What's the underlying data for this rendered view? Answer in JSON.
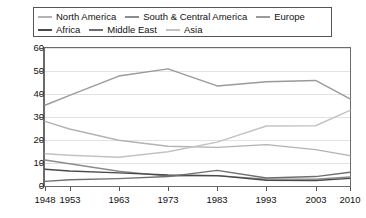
{
  "legend": {
    "rows": [
      [
        {
          "label": "North America",
          "color": "#b3b3b3"
        },
        {
          "label": "South & Central America",
          "color": "#8c8c8c"
        },
        {
          "label": "Europe",
          "color": "#9a9a9a"
        }
      ],
      [
        {
          "label": "Africa",
          "color": "#4a4a4a"
        },
        {
          "label": "Middle East",
          "color": "#6f6f6f"
        },
        {
          "label": "Asia",
          "color": "#c2c2c2"
        }
      ]
    ]
  },
  "axes": {
    "y_ticks": [
      "60",
      "50",
      "40",
      "30",
      "20",
      "10",
      "0"
    ],
    "x_ticks": [
      "1948",
      "1953",
      "1963",
      "1973",
      "1983",
      "1993",
      "2003",
      "2010"
    ]
  },
  "chart_data": {
    "type": "line",
    "title": "",
    "subtitle": "",
    "xlabel": "",
    "ylabel": "",
    "x": [
      1948,
      1953,
      1963,
      1973,
      1983,
      1993,
      2003,
      2010
    ],
    "categories": [
      "1948",
      "1953",
      "1963",
      "1973",
      "1983",
      "1993",
      "2003",
      "2010"
    ],
    "xlim": [
      1948,
      2010
    ],
    "ylim": [
      0,
      60
    ],
    "ytick_step": 10,
    "grid": true,
    "legend_position": "top",
    "series": [
      {
        "name": "North America",
        "color": "#b3b3b3",
        "values": [
          28.1,
          24.8,
          19.9,
          17.3,
          16.8,
          18.0,
          15.8,
          13.2
        ]
      },
      {
        "name": "South & Central America",
        "color": "#8c8c8c",
        "values": [
          11.3,
          9.7,
          6.4,
          4.3,
          4.5,
          3.0,
          3.0,
          3.9
        ]
      },
      {
        "name": "Europe",
        "color": "#9a9a9a",
        "values": [
          35.1,
          39.4,
          47.8,
          50.9,
          43.5,
          45.3,
          45.9,
          37.9
        ]
      },
      {
        "name": "Africa",
        "color": "#4a4a4a",
        "values": [
          7.3,
          6.5,
          5.7,
          4.8,
          4.5,
          2.5,
          2.4,
          3.3
        ]
      },
      {
        "name": "Middle East",
        "color": "#6f6f6f",
        "values": [
          2.0,
          2.7,
          3.2,
          4.1,
          6.8,
          3.5,
          4.1,
          6.0
        ]
      },
      {
        "name": "Asia",
        "color": "#c2c2c2",
        "values": [
          14.0,
          13.4,
          12.5,
          14.9,
          19.1,
          26.1,
          26.2,
          32.9
        ]
      }
    ]
  }
}
